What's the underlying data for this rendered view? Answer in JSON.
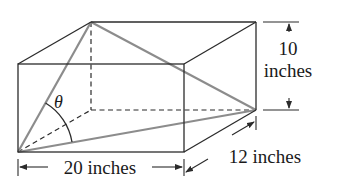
{
  "figure": {
    "type": "rectangular-box-diagram",
    "angle_label": "θ",
    "dimensions": {
      "length": {
        "value": "20",
        "unit": "inches",
        "label": "20 inches"
      },
      "width": {
        "value": "12",
        "unit": "inches",
        "label": "12 inches"
      },
      "height": {
        "value": "10",
        "unit": "inches",
        "label_line1": "10",
        "label_line2": "inches"
      }
    },
    "colors": {
      "edges": "#2b2b2b",
      "diagonals": "#8c8c8c",
      "background": "#ffffff"
    }
  }
}
